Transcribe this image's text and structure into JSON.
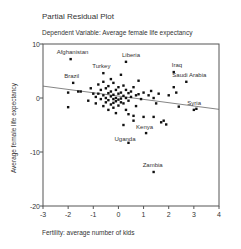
{
  "chart_data": {
    "type": "scatter",
    "title": "Partial Residual Plot",
    "subtitle": "Dependent Variable: Average female life expectancy",
    "xlabel": "Fertility: average number of kids",
    "ylabel": "Average female life expectancy",
    "xlim": [
      -3,
      4
    ],
    "ylim": [
      -20,
      10
    ],
    "xticks": [
      -3,
      -2,
      -1,
      0,
      1,
      2,
      3,
      4
    ],
    "yticks": [
      -20,
      -10,
      0,
      10
    ],
    "grid": false,
    "legend": null,
    "fit_line": {
      "x": [
        -3,
        4
      ],
      "y": [
        2.2,
        -2.1
      ]
    },
    "labeled_points": [
      {
        "label": "Afghanistan",
        "x": -1.9,
        "y": 7.2
      },
      {
        "label": "Brazil",
        "x": -1.8,
        "y": 2.8
      },
      {
        "label": "Turkey",
        "x": -0.6,
        "y": 4.6
      },
      {
        "label": "Liberia",
        "x": 0.3,
        "y": 6.7
      },
      {
        "label": "Iraq",
        "x": 2.2,
        "y": 4.8
      },
      {
        "label": "Saudi Arabia",
        "x": 2.7,
        "y": 3.0
      },
      {
        "label": "Syria",
        "x": 3.1,
        "y": -2.0
      },
      {
        "label": "Kenya",
        "x": 1.1,
        "y": -6.5
      },
      {
        "label": "Uganda",
        "x": 0.4,
        "y": -8.3
      },
      {
        "label": "Zambia",
        "x": 1.4,
        "y": -13.7
      }
    ],
    "points": [
      [
        -2.0,
        1.0
      ],
      [
        -2.0,
        -1.7
      ],
      [
        -1.6,
        1.2
      ],
      [
        -1.5,
        1.2
      ],
      [
        -1.2,
        -0.5
      ],
      [
        -1.1,
        1.8
      ],
      [
        -1.0,
        0.8
      ],
      [
        -0.9,
        0.2
      ],
      [
        -0.9,
        -1.0
      ],
      [
        -0.8,
        2.5
      ],
      [
        -0.8,
        0.8
      ],
      [
        -0.7,
        1.5
      ],
      [
        -0.7,
        -0.2
      ],
      [
        -0.6,
        3.0
      ],
      [
        -0.6,
        0.5
      ],
      [
        -0.6,
        -1.5
      ],
      [
        -0.5,
        1.8
      ],
      [
        -0.5,
        0.0
      ],
      [
        -0.5,
        -0.8
      ],
      [
        -0.4,
        2.2
      ],
      [
        -0.4,
        0.9
      ],
      [
        -0.4,
        -0.4
      ],
      [
        -0.4,
        -2.2
      ],
      [
        -0.3,
        3.5
      ],
      [
        -0.3,
        1.2
      ],
      [
        -0.3,
        0.3
      ],
      [
        -0.3,
        -1.2
      ],
      [
        -0.2,
        2.8
      ],
      [
        -0.2,
        0.6
      ],
      [
        -0.2,
        -0.2
      ],
      [
        -0.2,
        -0.9
      ],
      [
        -0.2,
        -1.8
      ],
      [
        -0.1,
        1.5
      ],
      [
        -0.1,
        0.0
      ],
      [
        -0.1,
        -0.6
      ],
      [
        -0.1,
        -2.8
      ],
      [
        0.0,
        2.0
      ],
      [
        0.0,
        0.8
      ],
      [
        0.0,
        -0.3
      ],
      [
        0.0,
        -1.4
      ],
      [
        0.1,
        1.0
      ],
      [
        0.1,
        -0.1
      ],
      [
        0.1,
        -0.8
      ],
      [
        0.1,
        4.3
      ],
      [
        0.2,
        2.3
      ],
      [
        0.2,
        0.4
      ],
      [
        0.2,
        -1.0
      ],
      [
        0.2,
        -5.0
      ],
      [
        0.3,
        1.5
      ],
      [
        0.3,
        0.0
      ],
      [
        0.3,
        -2.2
      ],
      [
        0.4,
        0.9
      ],
      [
        0.4,
        -0.5
      ],
      [
        0.4,
        -3.0
      ],
      [
        0.5,
        1.2
      ],
      [
        0.5,
        0.2
      ],
      [
        0.6,
        2.0
      ],
      [
        0.6,
        -3.3
      ],
      [
        0.6,
        -4.2
      ],
      [
        0.7,
        0.5
      ],
      [
        0.7,
        -1.5
      ],
      [
        0.8,
        3.2
      ],
      [
        0.8,
        0.7
      ],
      [
        0.9,
        -0.2
      ],
      [
        1.0,
        1.0
      ],
      [
        1.0,
        -3.5
      ],
      [
        1.2,
        0.5
      ],
      [
        1.3,
        1.3
      ],
      [
        1.4,
        0.0
      ],
      [
        1.4,
        -3.5
      ],
      [
        1.5,
        -1.0
      ],
      [
        1.6,
        0.8
      ],
      [
        1.7,
        -4.5
      ],
      [
        1.8,
        -4.2
      ],
      [
        1.9,
        -4.9
      ],
      [
        2.0,
        0.5
      ],
      [
        2.2,
        2.0
      ],
      [
        2.3,
        1.0
      ],
      [
        2.4,
        -1.6
      ],
      [
        3.0,
        -2.2
      ]
    ]
  }
}
